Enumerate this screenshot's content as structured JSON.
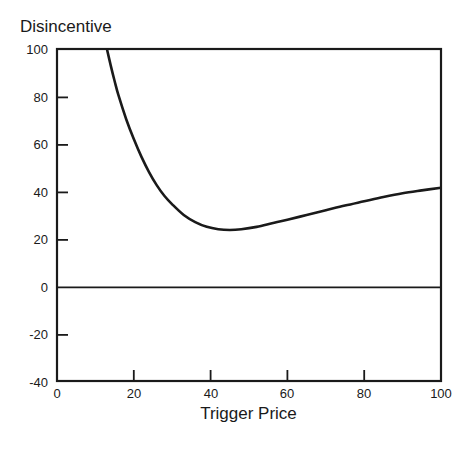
{
  "chart_data": {
    "type": "line",
    "title": "Disincentive",
    "subtitle": "",
    "xlabel": "Trigger Price",
    "ylabel": "Disincentive",
    "ylabel_position": "above-axis-top-left",
    "xlim": [
      0,
      100
    ],
    "ylim": [
      -40,
      100
    ],
    "xticks": [
      0,
      20,
      40,
      60,
      80,
      100
    ],
    "xtick_labels": [
      "0",
      "20",
      "40",
      "60",
      "80",
      "100"
    ],
    "yticks": [
      -40,
      -20,
      0,
      20,
      40,
      60,
      80,
      100
    ],
    "ytick_labels": [
      "-40",
      "-20",
      "0",
      "20",
      "40",
      "60",
      "80",
      "100"
    ],
    "grid": false,
    "legend": null,
    "tick_direction": "in",
    "frame": "full-box",
    "zero_line": {
      "value": 0,
      "span": [
        0,
        100
      ],
      "style": "solid-thin",
      "color": "#1a1a1a"
    },
    "series": [
      {
        "name": "Disincentive",
        "color": "#1a1a1a",
        "linewidth": 2.6,
        "x": [
          13.0,
          14.0,
          15.0,
          16.0,
          18.0,
          20.0,
          22.0,
          24.0,
          26.0,
          28.0,
          30.0,
          33.0,
          36.0,
          39.0,
          42.0,
          45.0,
          48.0,
          52.0,
          56.0,
          60.0,
          65.0,
          70.0,
          75.0,
          80.0,
          85.0,
          90.0,
          95.0,
          100.0
        ],
        "y": [
          100.0,
          93.0,
          86.5,
          80.5,
          70.5,
          62.0,
          54.5,
          48.0,
          42.5,
          38.0,
          34.5,
          30.0,
          27.0,
          25.0,
          24.0,
          23.7,
          24.0,
          25.0,
          26.5,
          28.0,
          30.0,
          32.0,
          34.0,
          35.8,
          37.6,
          39.2,
          40.4,
          41.5
        ]
      }
    ],
    "annotations": [
      {
        "text": "Curve is U-shaped: falls steeply from 100 at Trigger Price ~13, reaches a minimum of about 24 near Trigger Price 43, then rises slowly and almost linearly to about 42 at Trigger Price 100."
      }
    ]
  },
  "colors": {
    "axis": "#1a1a1a",
    "curve": "#1a1a1a",
    "background": "#ffffff"
  }
}
